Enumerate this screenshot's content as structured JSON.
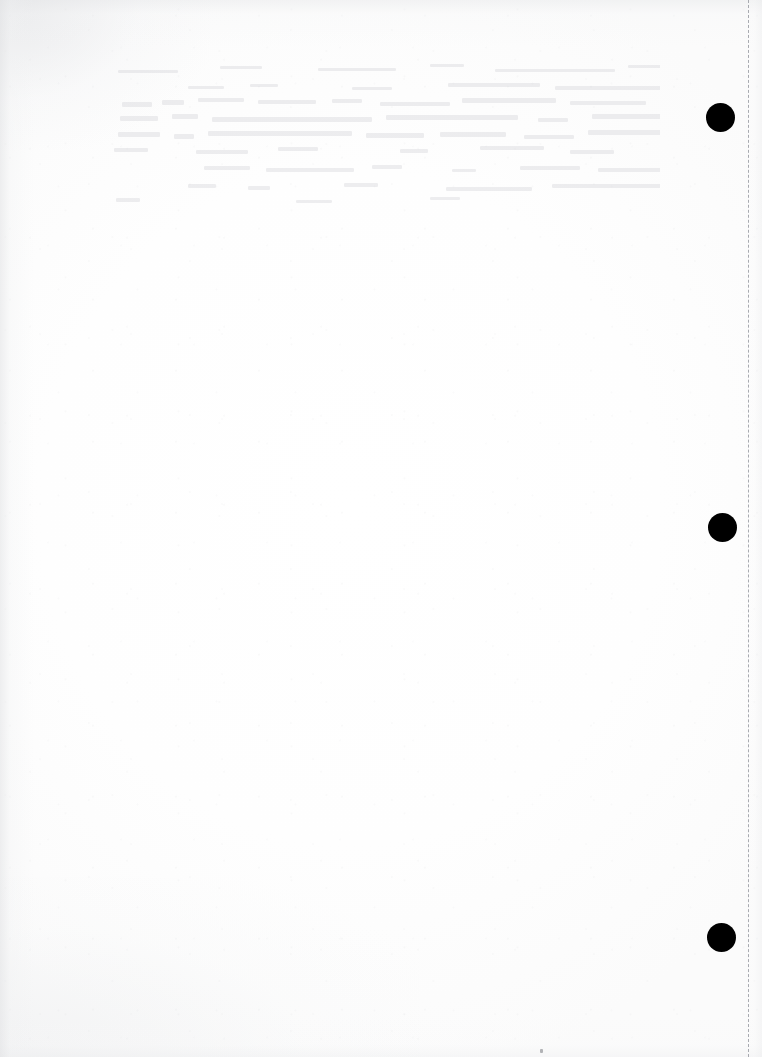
{
  "document": {
    "title": "Scanned Blank Page",
    "page_label": "blank page",
    "content_text": "",
    "background_color": "#fdfdfd",
    "ink_color": "#000000",
    "width_px": 762,
    "height_px": 1057
  },
  "marks": {
    "punch_dots_label": "registration mark",
    "punch_dots": [
      {
        "name": "registration-mark-top",
        "cx": 720,
        "cy": 117,
        "d": 29,
        "color": "#000000"
      },
      {
        "name": "registration-mark-middle",
        "cx": 722,
        "cy": 527,
        "d": 29,
        "color": "#000000"
      },
      {
        "name": "registration-mark-bottom",
        "cx": 721,
        "cy": 937,
        "d": 29,
        "color": "#000000"
      }
    ],
    "crop_line": {
      "name": "crop-line-right",
      "label": "dashed trim line",
      "x": 748,
      "color": "#a8aab0",
      "style": "dashed"
    },
    "speck": {
      "name": "ink-speck",
      "x": 540,
      "y": 1049,
      "w": 3,
      "h": 4
    }
  },
  "ghosting": {
    "label": "bleed-through from reverse side",
    "region": {
      "x": 100,
      "y": 62,
      "w": 560,
      "h": 150
    },
    "lines": [
      {
        "x": 18,
        "y": 8,
        "w": 60,
        "h": 3
      },
      {
        "x": 120,
        "y": 4,
        "w": 42,
        "h": 3
      },
      {
        "x": 218,
        "y": 6,
        "w": 78,
        "h": 3
      },
      {
        "x": 330,
        "y": 2,
        "w": 34,
        "h": 3
      },
      {
        "x": 395,
        "y": 7,
        "w": 120,
        "h": 3
      },
      {
        "x": 528,
        "y": 3,
        "w": 62,
        "h": 3
      },
      {
        "x": 88,
        "y": 24,
        "w": 36,
        "h": 3
      },
      {
        "x": 150,
        "y": 22,
        "w": 28,
        "h": 3
      },
      {
        "x": 252,
        "y": 25,
        "w": 40,
        "h": 3
      },
      {
        "x": 348,
        "y": 21,
        "w": 92,
        "h": 4
      },
      {
        "x": 455,
        "y": 24,
        "w": 108,
        "h": 4
      },
      {
        "x": 22,
        "y": 40,
        "w": 30,
        "h": 5
      },
      {
        "x": 62,
        "y": 38,
        "w": 22,
        "h": 5
      },
      {
        "x": 98,
        "y": 36,
        "w": 46,
        "h": 4
      },
      {
        "x": 158,
        "y": 38,
        "w": 58,
        "h": 4
      },
      {
        "x": 232,
        "y": 37,
        "w": 30,
        "h": 4
      },
      {
        "x": 280,
        "y": 40,
        "w": 70,
        "h": 4
      },
      {
        "x": 362,
        "y": 36,
        "w": 94,
        "h": 5
      },
      {
        "x": 470,
        "y": 39,
        "w": 76,
        "h": 4
      },
      {
        "x": 20,
        "y": 54,
        "w": 38,
        "h": 5
      },
      {
        "x": 72,
        "y": 52,
        "w": 26,
        "h": 5
      },
      {
        "x": 112,
        "y": 55,
        "w": 160,
        "h": 5
      },
      {
        "x": 286,
        "y": 53,
        "w": 132,
        "h": 5
      },
      {
        "x": 438,
        "y": 56,
        "w": 30,
        "h": 4
      },
      {
        "x": 492,
        "y": 52,
        "w": 72,
        "h": 5
      },
      {
        "x": 18,
        "y": 70,
        "w": 42,
        "h": 5
      },
      {
        "x": 74,
        "y": 72,
        "w": 20,
        "h": 5
      },
      {
        "x": 108,
        "y": 69,
        "w": 144,
        "h": 5
      },
      {
        "x": 266,
        "y": 71,
        "w": 58,
        "h": 5
      },
      {
        "x": 340,
        "y": 70,
        "w": 66,
        "h": 5
      },
      {
        "x": 424,
        "y": 73,
        "w": 50,
        "h": 4
      },
      {
        "x": 488,
        "y": 68,
        "w": 86,
        "h": 5
      },
      {
        "x": 14,
        "y": 86,
        "w": 34,
        "h": 4
      },
      {
        "x": 96,
        "y": 88,
        "w": 52,
        "h": 4
      },
      {
        "x": 178,
        "y": 85,
        "w": 40,
        "h": 4
      },
      {
        "x": 300,
        "y": 87,
        "w": 28,
        "h": 4
      },
      {
        "x": 380,
        "y": 84,
        "w": 64,
        "h": 4
      },
      {
        "x": 470,
        "y": 88,
        "w": 44,
        "h": 4
      },
      {
        "x": 104,
        "y": 104,
        "w": 46,
        "h": 4
      },
      {
        "x": 166,
        "y": 106,
        "w": 88,
        "h": 4
      },
      {
        "x": 272,
        "y": 103,
        "w": 30,
        "h": 4
      },
      {
        "x": 352,
        "y": 107,
        "w": 24,
        "h": 3
      },
      {
        "x": 420,
        "y": 104,
        "w": 60,
        "h": 4
      },
      {
        "x": 498,
        "y": 106,
        "w": 78,
        "h": 4
      },
      {
        "x": 88,
        "y": 122,
        "w": 28,
        "h": 4
      },
      {
        "x": 148,
        "y": 124,
        "w": 22,
        "h": 4
      },
      {
        "x": 244,
        "y": 121,
        "w": 34,
        "h": 4
      },
      {
        "x": 346,
        "y": 125,
        "w": 86,
        "h": 4
      },
      {
        "x": 452,
        "y": 122,
        "w": 110,
        "h": 4
      },
      {
        "x": 16,
        "y": 136,
        "w": 24,
        "h": 4
      },
      {
        "x": 196,
        "y": 138,
        "w": 36,
        "h": 3
      },
      {
        "x": 330,
        "y": 135,
        "w": 30,
        "h": 3
      }
    ]
  }
}
